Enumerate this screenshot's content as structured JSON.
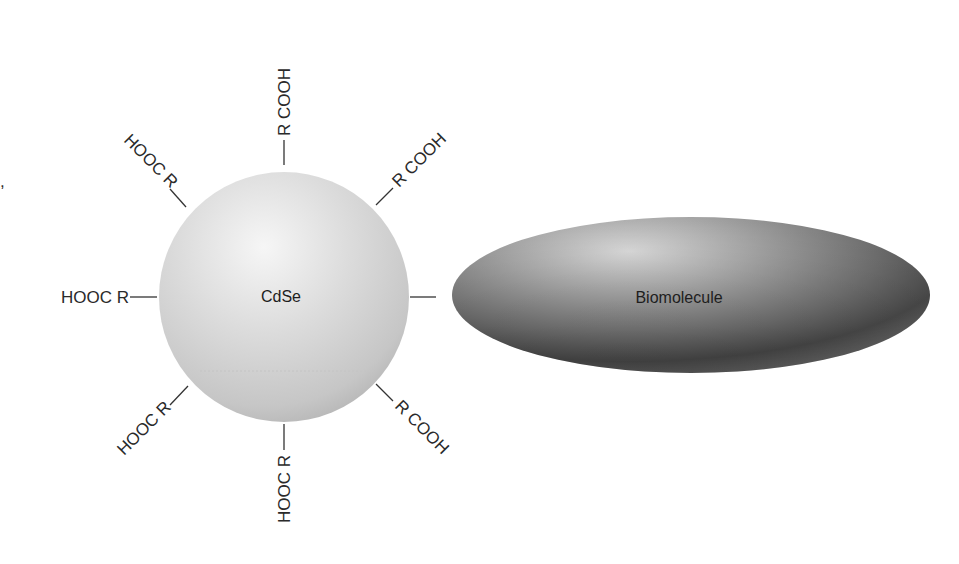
{
  "diagram": {
    "nanoparticle": {
      "label": "CdSe",
      "shape": "sphere",
      "colors": {
        "highlight": "#f4f4f4",
        "mid": "#d6d6d6",
        "edge": "#b8b8b8"
      }
    },
    "biomolecule": {
      "label": "Biomolecule",
      "shape": "ellipsoid",
      "colors": {
        "highlight": "#d4d4d4",
        "mid": "#8a8a8a",
        "edge": "#3a3a3a"
      }
    },
    "ligands": [
      {
        "position": "top",
        "text": "R COOH"
      },
      {
        "position": "top-right",
        "text": "R COOH"
      },
      {
        "position": "bottom-right",
        "text": "R COOH"
      },
      {
        "position": "top-left",
        "text": "HOOC R"
      },
      {
        "position": "left",
        "text": "HOOC R"
      },
      {
        "position": "bottom-left",
        "text": "HOOC R"
      },
      {
        "position": "bottom",
        "text": "HOOC R"
      }
    ],
    "stray_mark": ","
  }
}
